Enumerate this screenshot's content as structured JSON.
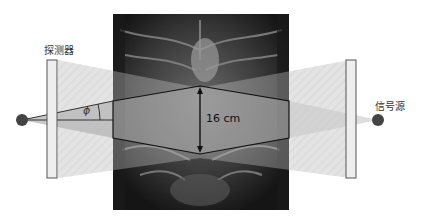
{
  "diagram": {
    "detector_label": "探测器",
    "source_label": "信号源",
    "dimension_label": "16 cm",
    "angle_symbol": "ϕ",
    "colors": {
      "background": "#ffffff",
      "panel_fill": "#eeeeee",
      "panel_stroke": "#555555",
      "dot_fill": "#444444",
      "beam_light": "#dddddd",
      "beam_dark": "#bbbbbb",
      "ct_image": "#2a2a2a",
      "outline": "#111111"
    }
  }
}
